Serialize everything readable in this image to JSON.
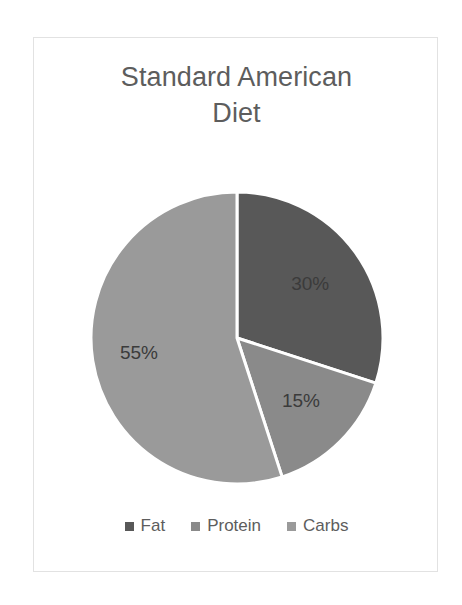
{
  "card": {
    "border_color": "#e2e2e2",
    "background": "#ffffff"
  },
  "title": {
    "text": "Standard American\nDiet",
    "color": "#5d5d5d"
  },
  "legend": {
    "items": [
      {
        "label": "Fat",
        "color": "#585858",
        "marker": "square-marker"
      },
      {
        "label": "Protein",
        "color": "#8a8a8a",
        "marker": "square-marker"
      },
      {
        "label": "Carbs",
        "color": "#9a9a9a",
        "marker": "square-marker"
      }
    ]
  },
  "chart_data": {
    "type": "pie",
    "title": "Standard American Diet",
    "categories": [
      "Fat",
      "Protein",
      "Carbs"
    ],
    "values": [
      30,
      15,
      55
    ],
    "data_labels": [
      "30%",
      "15%",
      "55%"
    ],
    "colors": [
      "#585858",
      "#8a8a8a",
      "#9a9a9a"
    ],
    "units": "percent",
    "total": 100,
    "start_angle_deg": 0,
    "direction": "clockwise",
    "slice_border_color": "#ffffff",
    "slice_border_width": 3,
    "legend_position": "bottom",
    "grid": false,
    "slices": [
      {
        "name": "Fat",
        "value": 30,
        "label": "30%",
        "color": "#585858",
        "start_deg": 0,
        "end_deg": 108
      },
      {
        "name": "Protein",
        "value": 15,
        "label": "15%",
        "color": "#8a8a8a",
        "start_deg": 108,
        "end_deg": 162
      },
      {
        "name": "Carbs",
        "value": 55,
        "label": "55%",
        "color": "#9a9a9a",
        "start_deg": 162,
        "end_deg": 360
      }
    ]
  }
}
